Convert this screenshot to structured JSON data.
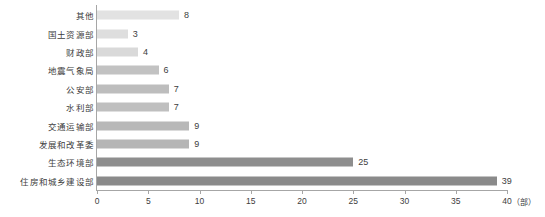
{
  "chart_data": {
    "type": "bar",
    "orientation": "horizontal",
    "title": "",
    "xlabel": "",
    "ylabel": "",
    "unit_label": "（部）",
    "xlim": [
      0,
      40
    ],
    "xticks": [
      0,
      5,
      10,
      15,
      20,
      25,
      30,
      35,
      40
    ],
    "xtick_labels": [
      "0",
      "5",
      "10",
      "15",
      "20",
      "25",
      "30",
      "35",
      "40"
    ],
    "grid": false,
    "legend": null,
    "categories": [
      "其他",
      "国土资源部",
      "财政部",
      "地震气象局",
      "公安部",
      "水利部",
      "交通运输部",
      "发展和改革委",
      "生态环境部",
      "住房和城乡建设部"
    ],
    "values": [
      8,
      3,
      4,
      6,
      7,
      7,
      9,
      9,
      25,
      39
    ],
    "value_labels": [
      "8",
      "3",
      "4",
      "6",
      "7",
      "7",
      "9",
      "9",
      "25",
      "39"
    ],
    "bar_colors": [
      "#e2e2e2",
      "#dedede",
      "#d9d9d9",
      "#c2c2c2",
      "#bdbdbd",
      "#bfbfbf",
      "#b8b8b8",
      "#b5b5b5",
      "#8e8e8e",
      "#8a8a8a"
    ],
    "axis_color": "#a6a6a6",
    "text_color": "#3d3d3d"
  }
}
